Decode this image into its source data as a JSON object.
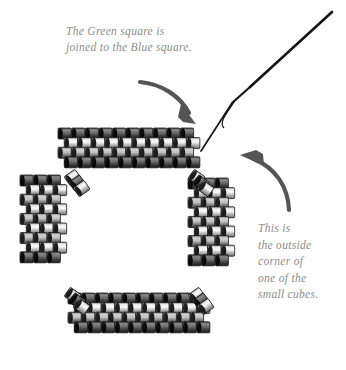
{
  "diagram": {
    "background_color": "#ffffff",
    "text_color": "#8d8d8d",
    "bead_dark": "#3a3a3a",
    "bead_light": "#d8d8d8",
    "annotations": {
      "top_note": "The Green square is\njoined to the Blue square.",
      "right_note": "This is\nthe outside\ncorner of\none of the\nsmall cubes."
    },
    "arrows": [
      {
        "name": "arrow-to-top-band",
        "direction": "curve-right-down",
        "color": "#555555"
      },
      {
        "name": "arrow-to-outside-corner",
        "direction": "curve-up-left",
        "color": "#555555"
      }
    ],
    "needle": {
      "name": "beading-needle",
      "color": "#1a1a1a",
      "tip_x": 201,
      "tip_y": 151,
      "tail_x": 332,
      "tail_y": 12
    },
    "thread": {
      "name": "thread-tail",
      "color": "#1a1a1a"
    },
    "bands": [
      {
        "name": "top-band",
        "cols": 10,
        "rows": 4,
        "x": 58,
        "y": 128,
        "orientation": "horizontal"
      },
      {
        "name": "bottom-band",
        "cols": 10,
        "rows": 4,
        "x": 68,
        "y": 293,
        "orientation": "horizontal"
      },
      {
        "name": "left-band",
        "cols": 3,
        "rows": 9,
        "x": 20,
        "y": 175,
        "orientation": "vertical"
      },
      {
        "name": "right-band",
        "cols": 3,
        "rows": 9,
        "x": 188,
        "y": 178,
        "orientation": "vertical"
      }
    ],
    "corner_joins": [
      {
        "name": "corner-join-top-left",
        "x": 66,
        "y": 172,
        "angle": -35
      },
      {
        "name": "corner-join-top-right",
        "x": 190,
        "y": 172,
        "angle": 35
      },
      {
        "name": "corner-join-bottom-left",
        "x": 66,
        "y": 290,
        "angle": 35
      },
      {
        "name": "corner-join-bottom-right",
        "x": 190,
        "y": 290,
        "angle": -35
      }
    ]
  }
}
